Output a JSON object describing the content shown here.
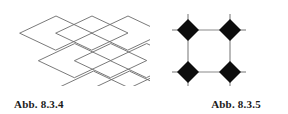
{
  "page": {
    "background_color": "#ffffff",
    "width": 288,
    "height": 114
  },
  "figures": [
    {
      "id": "abb-8-3-4",
      "caption": "Abb. 8.3.4",
      "kind": "rhombic-lattice",
      "description": "Overlapping rhombus (diamond) lattice drawn with thin grey lines",
      "stroke_color": "#6b6b6b",
      "stroke_width": 0.9,
      "fill": "none",
      "lattice": {
        "rhombus_half_width": 36,
        "rhombus_half_height": 17,
        "columns": 3,
        "rows": 3,
        "origin_x": 20,
        "origin_y": 12,
        "step_x": 36,
        "step_y": 17
      }
    },
    {
      "id": "abb-8-3-5",
      "caption": "Abb. 8.3.5",
      "kind": "diamond-square-motif",
      "description": "Four solid black diamonds at the corners of a square, joined by grey line segments with outward stubs",
      "stroke_color": "#8a8a8a",
      "stroke_width": 1.2,
      "diamond_fill": "#0d0d0d",
      "diamond_half_size": 11,
      "square_side": 42,
      "stub_length": 16,
      "nodes": [
        {
          "name": "top-left",
          "cx": 38,
          "cy": 26
        },
        {
          "name": "top-right",
          "cx": 80,
          "cy": 26
        },
        {
          "name": "bottom-left",
          "cx": 38,
          "cy": 68
        },
        {
          "name": "bottom-right",
          "cx": 80,
          "cy": 68
        }
      ]
    }
  ]
}
